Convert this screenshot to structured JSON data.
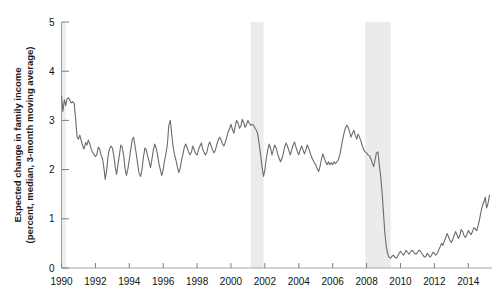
{
  "chart_data": {
    "type": "line",
    "title": "",
    "xlabel": "",
    "ylabel": "Expected change in family income\n(percent, median, 3-month moving average)",
    "ylabel_line1": "Expected change in family income",
    "ylabel_line2": "(percent, median, 3-month moving average)",
    "xlim": [
      1990.0,
      2015.4
    ],
    "ylim": [
      0,
      5
    ],
    "yticks": [
      0,
      1,
      2,
      3,
      4,
      5
    ],
    "ytick_labels": [
      "0",
      "1",
      "2",
      "3",
      "4",
      "5"
    ],
    "xticks": [
      1990,
      1992,
      1994,
      1996,
      1998,
      2000,
      2002,
      2004,
      2006,
      2008,
      2010,
      2012,
      2014
    ],
    "xtick_labels": [
      "1990",
      "1992",
      "1994",
      "1996",
      "1998",
      "2000",
      "2002",
      "2004",
      "2006",
      "2008",
      "2010",
      "2012",
      "2014"
    ],
    "grid": false,
    "legend": null,
    "series": [
      {
        "name": "Expected change in family income",
        "color": "#6b6b6b",
        "line_width": 1.1,
        "x": [
          1990.0,
          1990.08,
          1990.17,
          1990.25,
          1990.33,
          1990.42,
          1990.5,
          1990.58,
          1990.67,
          1990.75,
          1990.83,
          1990.92,
          1991.0,
          1991.08,
          1991.17,
          1991.25,
          1991.33,
          1991.42,
          1991.5,
          1991.58,
          1991.67,
          1991.75,
          1991.83,
          1991.92,
          1992.0,
          1992.08,
          1992.17,
          1992.25,
          1992.33,
          1992.42,
          1992.5,
          1992.58,
          1992.67,
          1992.75,
          1992.83,
          1992.92,
          1993.0,
          1993.08,
          1993.17,
          1993.25,
          1993.33,
          1993.42,
          1993.5,
          1993.58,
          1993.67,
          1993.75,
          1993.83,
          1993.92,
          1994.0,
          1994.08,
          1994.17,
          1994.25,
          1994.33,
          1994.42,
          1994.5,
          1994.58,
          1994.67,
          1994.75,
          1994.83,
          1994.92,
          1995.0,
          1995.08,
          1995.17,
          1995.25,
          1995.33,
          1995.42,
          1995.5,
          1995.58,
          1995.67,
          1995.75,
          1995.83,
          1995.92,
          1996.0,
          1996.08,
          1996.17,
          1996.25,
          1996.33,
          1996.42,
          1996.5,
          1996.58,
          1996.67,
          1996.75,
          1996.83,
          1996.92,
          1997.0,
          1997.08,
          1997.17,
          1997.25,
          1997.33,
          1997.42,
          1997.5,
          1997.58,
          1997.67,
          1997.75,
          1997.83,
          1997.92,
          1998.0,
          1998.08,
          1998.17,
          1998.25,
          1998.33,
          1998.42,
          1998.5,
          1998.58,
          1998.67,
          1998.75,
          1998.83,
          1998.92,
          1999.0,
          1999.08,
          1999.17,
          1999.25,
          1999.33,
          1999.42,
          1999.5,
          1999.58,
          1999.67,
          1999.75,
          1999.83,
          1999.92,
          2000.0,
          2000.08,
          2000.17,
          2000.25,
          2000.33,
          2000.42,
          2000.5,
          2000.58,
          2000.67,
          2000.75,
          2000.83,
          2000.92,
          2001.0,
          2001.08,
          2001.17,
          2001.25,
          2001.33,
          2001.42,
          2001.5,
          2001.58,
          2001.67,
          2001.75,
          2001.83,
          2001.92,
          2002.0,
          2002.08,
          2002.17,
          2002.25,
          2002.33,
          2002.42,
          2002.5,
          2002.58,
          2002.67,
          2002.75,
          2002.83,
          2002.92,
          2003.0,
          2003.08,
          2003.17,
          2003.25,
          2003.33,
          2003.42,
          2003.5,
          2003.58,
          2003.67,
          2003.75,
          2003.83,
          2003.92,
          2004.0,
          2004.08,
          2004.17,
          2004.25,
          2004.33,
          2004.42,
          2004.5,
          2004.58,
          2004.67,
          2004.75,
          2004.83,
          2004.92,
          2005.0,
          2005.08,
          2005.17,
          2005.25,
          2005.33,
          2005.42,
          2005.5,
          2005.58,
          2005.67,
          2005.75,
          2005.83,
          2005.92,
          2006.0,
          2006.08,
          2006.17,
          2006.25,
          2006.33,
          2006.42,
          2006.5,
          2006.58,
          2006.67,
          2006.75,
          2006.83,
          2006.92,
          2007.0,
          2007.08,
          2007.17,
          2007.25,
          2007.33,
          2007.42,
          2007.5,
          2007.58,
          2007.67,
          2007.75,
          2007.83,
          2007.92,
          2008.0,
          2008.08,
          2008.17,
          2008.25,
          2008.33,
          2008.42,
          2008.5,
          2008.58,
          2008.67,
          2008.75,
          2008.83,
          2008.92,
          2009.0,
          2009.08,
          2009.17,
          2009.25,
          2009.33,
          2009.42,
          2009.5,
          2009.58,
          2009.67,
          2009.75,
          2009.83,
          2009.92,
          2010.0,
          2010.08,
          2010.17,
          2010.25,
          2010.33,
          2010.42,
          2010.5,
          2010.58,
          2010.67,
          2010.75,
          2010.83,
          2010.92,
          2011.0,
          2011.08,
          2011.17,
          2011.25,
          2011.33,
          2011.42,
          2011.5,
          2011.58,
          2011.67,
          2011.75,
          2011.83,
          2011.92,
          2012.0,
          2012.08,
          2012.17,
          2012.25,
          2012.33,
          2012.42,
          2012.5,
          2012.58,
          2012.67,
          2012.75,
          2012.83,
          2012.92,
          2013.0,
          2013.08,
          2013.17,
          2013.25,
          2013.33,
          2013.42,
          2013.5,
          2013.58,
          2013.67,
          2013.75,
          2013.83,
          2013.92,
          2014.0,
          2014.08,
          2014.17,
          2014.25,
          2014.33,
          2014.42,
          2014.5,
          2014.58,
          2014.67,
          2014.75,
          2014.83,
          2014.92,
          2015.0,
          2015.08,
          2015.17,
          2015.25
        ],
        "y": [
          3.5,
          3.18,
          3.42,
          3.3,
          3.44,
          3.46,
          3.4,
          3.36,
          3.38,
          3.34,
          3.05,
          2.66,
          2.62,
          2.7,
          2.58,
          2.48,
          2.42,
          2.55,
          2.5,
          2.6,
          2.52,
          2.42,
          2.36,
          2.3,
          2.27,
          2.3,
          2.45,
          2.42,
          2.3,
          2.22,
          2.04,
          1.8,
          2.0,
          2.28,
          2.42,
          2.48,
          2.44,
          2.3,
          2.05,
          1.9,
          2.1,
          2.3,
          2.5,
          2.46,
          2.28,
          2.02,
          1.88,
          2.02,
          2.2,
          2.4,
          2.6,
          2.66,
          2.5,
          2.3,
          2.1,
          1.92,
          1.86,
          2.0,
          2.24,
          2.44,
          2.4,
          2.28,
          2.16,
          2.04,
          2.2,
          2.4,
          2.52,
          2.44,
          2.3,
          2.12,
          2.0,
          1.88,
          2.0,
          2.18,
          2.34,
          2.52,
          2.9,
          3.0,
          2.72,
          2.48,
          2.3,
          2.2,
          2.06,
          1.94,
          2.02,
          2.18,
          2.32,
          2.46,
          2.52,
          2.44,
          2.36,
          2.3,
          2.36,
          2.48,
          2.4,
          2.32,
          2.3,
          2.4,
          2.48,
          2.54,
          2.42,
          2.34,
          2.3,
          2.36,
          2.5,
          2.56,
          2.48,
          2.4,
          2.34,
          2.4,
          2.52,
          2.6,
          2.66,
          2.6,
          2.52,
          2.48,
          2.56,
          2.66,
          2.76,
          2.84,
          2.92,
          2.82,
          2.74,
          2.88,
          3.0,
          2.94,
          2.84,
          2.88,
          3.02,
          2.96,
          2.86,
          2.92,
          3.0,
          2.94,
          2.9,
          2.92,
          2.9,
          2.84,
          2.8,
          2.72,
          2.5,
          2.3,
          2.06,
          1.86,
          2.0,
          2.22,
          2.4,
          2.52,
          2.44,
          2.3,
          2.4,
          2.5,
          2.44,
          2.32,
          2.24,
          2.16,
          2.22,
          2.32,
          2.46,
          2.54,
          2.48,
          2.38,
          2.3,
          2.4,
          2.5,
          2.56,
          2.46,
          2.36,
          2.3,
          2.4,
          2.48,
          2.4,
          2.32,
          2.4,
          2.5,
          2.44,
          2.34,
          2.26,
          2.2,
          2.14,
          2.1,
          2.02,
          1.96,
          2.06,
          2.2,
          2.32,
          2.24,
          2.16,
          2.1,
          2.16,
          2.1,
          2.14,
          2.1,
          2.16,
          2.12,
          2.16,
          2.2,
          2.3,
          2.44,
          2.6,
          2.74,
          2.84,
          2.9,
          2.86,
          2.76,
          2.66,
          2.74,
          2.8,
          2.7,
          2.62,
          2.72,
          2.66,
          2.58,
          2.48,
          2.4,
          2.36,
          2.34,
          2.3,
          2.28,
          2.22,
          2.14,
          2.06,
          2.2,
          2.34,
          2.36,
          2.1,
          1.86,
          1.52,
          1.1,
          0.7,
          0.42,
          0.28,
          0.22,
          0.2,
          0.24,
          0.26,
          0.22,
          0.2,
          0.24,
          0.3,
          0.34,
          0.3,
          0.26,
          0.3,
          0.36,
          0.32,
          0.28,
          0.32,
          0.36,
          0.34,
          0.3,
          0.28,
          0.32,
          0.36,
          0.34,
          0.3,
          0.26,
          0.22,
          0.24,
          0.3,
          0.26,
          0.22,
          0.26,
          0.32,
          0.3,
          0.26,
          0.3,
          0.36,
          0.42,
          0.5,
          0.46,
          0.54,
          0.62,
          0.7,
          0.64,
          0.56,
          0.52,
          0.58,
          0.66,
          0.74,
          0.68,
          0.6,
          0.66,
          0.78,
          0.74,
          0.66,
          0.62,
          0.68,
          0.76,
          0.72,
          0.68,
          0.74,
          0.82,
          0.8,
          0.76,
          0.86,
          1.0,
          1.14,
          1.26,
          1.34,
          1.44,
          1.22,
          1.32,
          1.48
        ]
      }
    ],
    "recession_bands": [
      {
        "label": "1990-1991 recession",
        "start": 1990.0,
        "end": 1990.25,
        "color": "#ededed"
      },
      {
        "label": "2001 recession",
        "start": 2001.17,
        "end": 2001.92,
        "color": "#ebebeb"
      },
      {
        "label": "2007-2009 recession",
        "start": 2007.92,
        "end": 2009.42,
        "color": "#ebebeb"
      }
    ],
    "axis_color": "#9a9a9a",
    "tick_color": "#7d7d7d",
    "line_color": "#6b6b6b"
  }
}
